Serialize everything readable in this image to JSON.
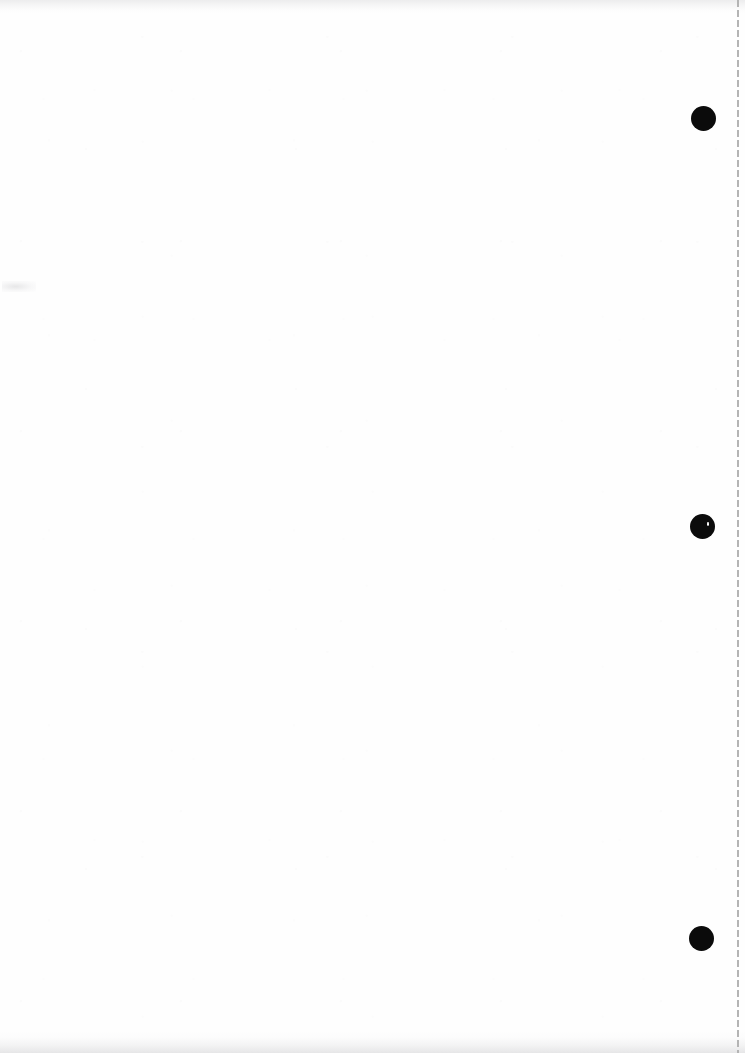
{
  "document": {
    "title": "Scanned Blank Page",
    "page_width": 745,
    "page_height": 1053,
    "background_color": "#fefefe",
    "content_text": "",
    "note": "Blank scanned sheet — no printed text present"
  },
  "marks": {
    "ink_color": "#0b0b0b",
    "punch_holes": [
      {
        "label": "binding-mark-top",
        "x": 691,
        "y": 106,
        "diameter": 25,
        "has_speck": false
      },
      {
        "label": "binding-mark-middle",
        "x": 690,
        "y": 514,
        "diameter": 25,
        "has_speck": true
      },
      {
        "label": "binding-mark-bottom",
        "x": 689,
        "y": 926,
        "diameter": 25,
        "has_speck": false
      }
    ]
  },
  "perforation": {
    "label": "perforation-line",
    "x": 737,
    "top": 0,
    "height": 1053,
    "color": "#b4b4b4",
    "dash_length": 7,
    "gap_length": 3,
    "thickness": 2
  },
  "artifacts": {
    "top_edge_shadow": {
      "label": "top-edge-shadow",
      "height": 14
    },
    "bottom_edge_shadow": {
      "label": "bottom-edge-shadow",
      "height": 22
    },
    "stray_marks": [
      {
        "label": "stray-scan-mark-left",
        "x": 2,
        "y": 281,
        "width": 34,
        "height": 11
      }
    ]
  }
}
